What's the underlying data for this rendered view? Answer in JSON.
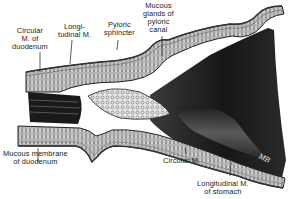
{
  "figure": {
    "signature": "MB",
    "labels": [
      {
        "id": "circular-m-duodenum",
        "text": "Circular\nM. of\nduodenum"
      },
      {
        "id": "longitudinal-m",
        "text": "Longi-\ntudinal M."
      },
      {
        "id": "pyloric-sphincter",
        "text": "Pyloric\nsphincter"
      },
      {
        "id": "mucous-glands",
        "text": "Mucous\nglands of\npyloric\ncanal"
      },
      {
        "id": "mucous-membrane-duodenum",
        "text": "Mucous membrane\nof duodenum"
      },
      {
        "id": "circular-m",
        "text": "Circular M."
      },
      {
        "id": "longitudinal-m-stomach",
        "text": "Longitudinal M.\nof stomach"
      }
    ]
  }
}
